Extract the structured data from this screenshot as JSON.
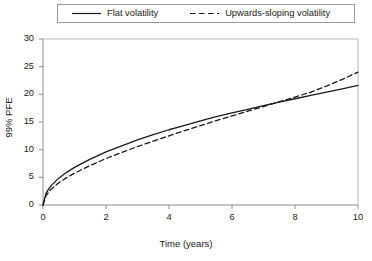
{
  "chart_data": {
    "type": "line",
    "title": "",
    "xlabel": "Time (years)",
    "ylabel": "99% PFE",
    "xlim": [
      0,
      10
    ],
    "ylim": [
      0,
      30
    ],
    "xticks": [
      "0",
      "2",
      "4",
      "6",
      "8",
      "10"
    ],
    "xtick_values": [
      0,
      2,
      4,
      6,
      8,
      10
    ],
    "yticks": [
      "0",
      "5",
      "10",
      "15",
      "20",
      "25",
      "30"
    ],
    "ytick_values": [
      0,
      5,
      10,
      15,
      20,
      25,
      30
    ],
    "grid": false,
    "legend_position": "top",
    "series": [
      {
        "name": "Flat volatility",
        "style": "solid",
        "color": "#1a1a1a",
        "x": [
          0,
          0.1,
          0.25,
          0.5,
          0.75,
          1,
          1.5,
          2,
          2.5,
          3,
          3.5,
          4,
          4.5,
          5,
          5.5,
          6,
          6.5,
          7,
          7.5,
          8,
          8.5,
          9,
          9.5,
          10
        ],
        "y": [
          0,
          2.2,
          3.45,
          4.85,
          5.9,
          6.8,
          8.3,
          9.6,
          10.7,
          11.75,
          12.7,
          13.6,
          14.4,
          15.2,
          15.95,
          16.65,
          17.3,
          17.95,
          18.6,
          19.2,
          19.8,
          20.4,
          21.0,
          21.6
        ]
      },
      {
        "name": "Upwards-sloping volatility",
        "style": "dashed",
        "color": "#1a1a1a",
        "x": [
          0,
          0.1,
          0.25,
          0.5,
          0.75,
          1,
          1.5,
          2,
          2.5,
          3,
          3.5,
          4,
          4.5,
          5,
          5.5,
          6,
          6.5,
          7,
          7.5,
          8,
          8.5,
          9,
          9.5,
          10
        ],
        "y": [
          0,
          1.75,
          2.8,
          4.0,
          4.95,
          5.75,
          7.15,
          8.4,
          9.5,
          10.55,
          11.55,
          12.5,
          13.45,
          14.35,
          15.25,
          16.1,
          16.95,
          17.8,
          18.65,
          19.5,
          20.4,
          21.5,
          22.7,
          24.0
        ]
      }
    ]
  },
  "legend": {
    "entries": [
      {
        "label": "Flat volatility",
        "style": "solid"
      },
      {
        "label": "Upwards-sloping volatility",
        "style": "dashed"
      }
    ]
  },
  "axes": {
    "x_title": "Time (years)",
    "y_title": "99% PFE",
    "x_ticks": [
      "0",
      "2",
      "4",
      "6",
      "8",
      "10"
    ],
    "y_ticks": [
      "30",
      "25",
      "20",
      "15",
      "10",
      "5",
      "0"
    ]
  },
  "colors": {
    "line": "#1a1a1a",
    "frame": "#8c8c8c",
    "background": "#ffffff"
  }
}
